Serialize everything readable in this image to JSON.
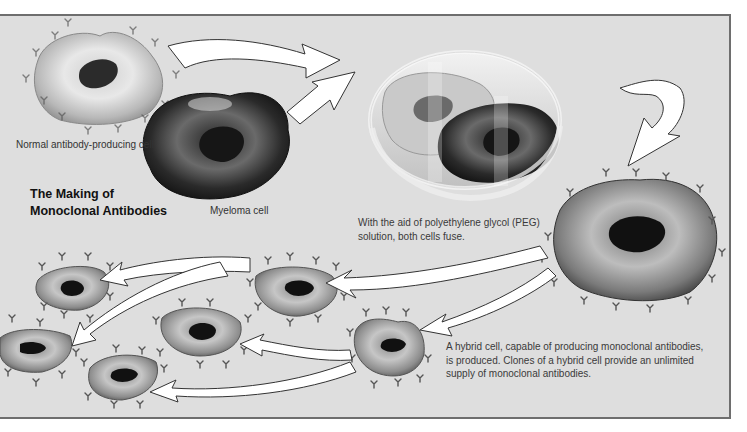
{
  "diagram": {
    "title_line1": "The Making of",
    "title_line2": "Monoclonal Antibodies",
    "labels": {
      "normal_cell": "Normal antibody-producing cell",
      "myeloma_cell": "Myeloma cell"
    },
    "captions": {
      "fusion_line1": "With the aid of polyethylene glycol (PEG)",
      "fusion_line2": "solution, both cells fuse.",
      "hybrid_line1": "A hybrid cell, capable of producing monoclonal antibodies,",
      "hybrid_line2": "is produced. Clones of a hybrid cell provide an unlimited",
      "hybrid_line3": "supply of monoclonal antibodies."
    },
    "stages": [
      "normal antibody-producing cell",
      "myeloma cell",
      "petri dish fusion with PEG",
      "hybrid cell (hybridoma)",
      "cloned hybrid cells"
    ],
    "colors": {
      "panel_bg": "#dedede",
      "border": "#6e6e6e",
      "arrow_fill": "#ffffff",
      "nucleus": "#1a1a1a"
    }
  }
}
